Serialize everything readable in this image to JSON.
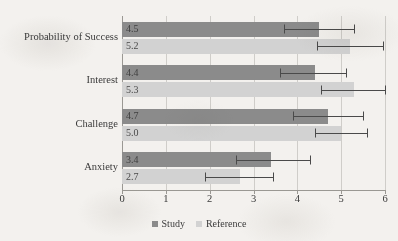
{
  "chart_data": {
    "type": "bar",
    "orientation": "horizontal",
    "title": "",
    "xlabel": "",
    "ylabel": "",
    "xlim": [
      0,
      6
    ],
    "xticks": [
      "0",
      "1",
      "2",
      "3",
      "4",
      "5",
      "6"
    ],
    "grid": true,
    "legend_position": "bottom",
    "categories": [
      "Probability of Success",
      "Interest",
      "Challenge",
      "Anxiety"
    ],
    "series": [
      {
        "name": "Study",
        "color": "#8b8b8b",
        "values": [
          4.5,
          4.4,
          4.7,
          3.4
        ],
        "labels": [
          "4.5",
          "4.4",
          "4.7",
          "3.4"
        ],
        "error_low": [
          3.7,
          3.6,
          3.9,
          2.6
        ],
        "error_high": [
          5.3,
          5.1,
          5.5,
          4.3
        ]
      },
      {
        "name": "Reference",
        "color": "#d2d2d2",
        "values": [
          5.2,
          5.3,
          5.0,
          2.7
        ],
        "labels": [
          "5.2",
          "5.3",
          "5.0",
          "2.7"
        ],
        "error_low": [
          4.45,
          4.55,
          4.4,
          1.9
        ],
        "error_high": [
          5.95,
          6.0,
          5.6,
          3.45
        ]
      }
    ]
  },
  "legend": {
    "items": [
      {
        "label": "Study",
        "swatch": "study"
      },
      {
        "label": "Reference",
        "swatch": "reference"
      }
    ]
  }
}
